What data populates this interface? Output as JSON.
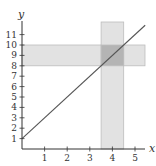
{
  "chart_data": {
    "type": "line",
    "title": "",
    "xlabel": "x",
    "ylabel": "y",
    "xlim": [
      0,
      5.4
    ],
    "ylim": [
      0,
      12
    ],
    "grid": false,
    "x_ticks": [
      1,
      2,
      3,
      4,
      5
    ],
    "y_ticks": [
      1,
      2,
      3,
      4,
      5,
      6,
      7,
      8,
      9,
      10,
      11
    ],
    "series": [
      {
        "name": "y = 2x + 1",
        "x": [
          0,
          5.45
        ],
        "y": [
          1,
          11.9
        ],
        "slope": 2,
        "intercept": 1
      }
    ],
    "shaded_regions": [
      {
        "name": "vertical-band",
        "axis": "x",
        "from": 3.5,
        "to": 4.5
      },
      {
        "name": "horizontal-band",
        "axis": "y",
        "from": 8,
        "to": 10
      }
    ],
    "annotations": []
  },
  "colors": {
    "axis": "#333333",
    "line": "#555555",
    "band": "#e2e2e2",
    "band_edge": "#bdbdbd",
    "overlap": "#b4b4b4"
  },
  "labels": {
    "x_axis": "x",
    "y_axis": "y",
    "x_ticks": [
      "1",
      "2",
      "3",
      "4",
      "5"
    ],
    "y_ticks": [
      "1",
      "2",
      "3",
      "4",
      "5",
      "6",
      "7",
      "8",
      "9",
      "10",
      "11"
    ]
  }
}
